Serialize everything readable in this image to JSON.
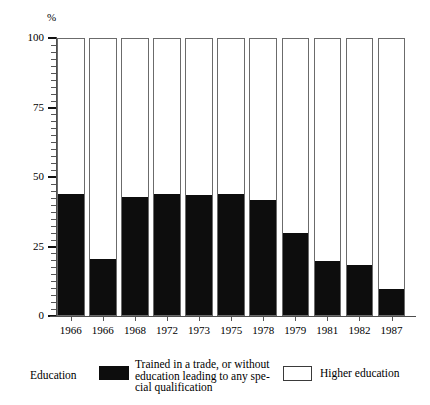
{
  "chart_data": {
    "type": "bar",
    "subtype": "stacked-100-percent",
    "title": "",
    "xlabel": "",
    "ylabel": "%",
    "ylim": [
      0,
      100
    ],
    "yticks": [
      0,
      25,
      50,
      75,
      100
    ],
    "ytick_labels": [
      "0",
      "25",
      "50",
      "75",
      "100"
    ],
    "minor_ticks": true,
    "grid": false,
    "categories": [
      "1966",
      "1966",
      "1968",
      "1972",
      "1973",
      "1975",
      "1978",
      "1979",
      "1981",
      "1982",
      "1987"
    ],
    "series": [
      {
        "name": "Trained in a trade, or without education leading to any special qualification",
        "color": "#0d0d0d",
        "values": [
          43.5,
          20,
          42.5,
          43.5,
          43,
          43.5,
          41.5,
          29.5,
          19.5,
          18,
          9.5
        ]
      },
      {
        "name": "Higher education",
        "color": "#ffffff",
        "values": [
          56.5,
          80,
          57.5,
          56.5,
          57,
          56.5,
          58.5,
          70.5,
          80.5,
          82,
          90.5
        ]
      }
    ],
    "legend_position": "bottom"
  },
  "axis": {
    "unit_label": "%",
    "y_tick_labels": [
      "100",
      "75",
      "50",
      "25",
      "0"
    ],
    "x_tick_labels": [
      "1966",
      "1966",
      "1968",
      "1972",
      "1973",
      "1975",
      "1978",
      "1979",
      "1981",
      "1982",
      "1987"
    ]
  },
  "legend": {
    "title": "Education",
    "item_black_line1": "Trained in a trade, or without",
    "item_black_line2": "education leading to any spe-",
    "item_black_line3": "cial qualification",
    "item_white": "Higher education",
    "black_color": "#0d0d0d",
    "white_color": "#ffffff"
  }
}
